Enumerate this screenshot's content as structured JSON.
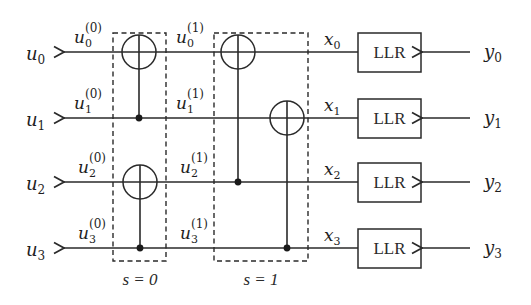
{
  "diagram": {
    "outputs": [
      {
        "name": "u",
        "sub": "0"
      },
      {
        "name": "u",
        "sub": "1"
      },
      {
        "name": "u",
        "sub": "2"
      },
      {
        "name": "u",
        "sub": "3"
      }
    ],
    "stage0_labels": [
      {
        "name": "u",
        "sub": "0",
        "sup": "(0)"
      },
      {
        "name": "u",
        "sub": "1",
        "sup": "(0)"
      },
      {
        "name": "u",
        "sub": "2",
        "sup": "(0)"
      },
      {
        "name": "u",
        "sub": "3",
        "sup": "(0)"
      }
    ],
    "stage1_labels": [
      {
        "name": "u",
        "sub": "0",
        "sup": "(1)"
      },
      {
        "name": "u",
        "sub": "1",
        "sup": "(1)"
      },
      {
        "name": "u",
        "sub": "2",
        "sup": "(1)"
      },
      {
        "name": "u",
        "sub": "3",
        "sup": "(1)"
      }
    ],
    "x_labels": [
      {
        "name": "x",
        "sub": "0"
      },
      {
        "name": "x",
        "sub": "1"
      },
      {
        "name": "x",
        "sub": "2"
      },
      {
        "name": "x",
        "sub": "3"
      }
    ],
    "llr_blocks": [
      "LLR",
      "LLR",
      "LLR",
      "LLR"
    ],
    "inputs": [
      {
        "name": "y",
        "sub": "0"
      },
      {
        "name": "y",
        "sub": "1"
      },
      {
        "name": "y",
        "sub": "2"
      },
      {
        "name": "y",
        "sub": "3"
      }
    ],
    "stages": [
      {
        "label": "s = 0"
      },
      {
        "label": "s = 1"
      }
    ]
  }
}
